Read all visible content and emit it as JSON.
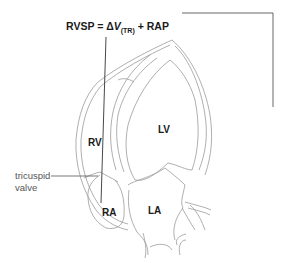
{
  "formula": {
    "lhs": "RVSP",
    "equals": "=",
    "delta": "Δ",
    "v": "V",
    "subscript": "(TR)",
    "plus": "+",
    "rhs": "RAP"
  },
  "labels": {
    "rv": "RV",
    "lv": "LV",
    "ra": "RA",
    "la": "LA"
  },
  "annotation": {
    "line1": "tricuspid",
    "line2": "valve"
  },
  "colors": {
    "outline": "#9a9a9a",
    "pointer": "#333333",
    "text": "#1a1a1a",
    "annotation_text": "#555555"
  }
}
